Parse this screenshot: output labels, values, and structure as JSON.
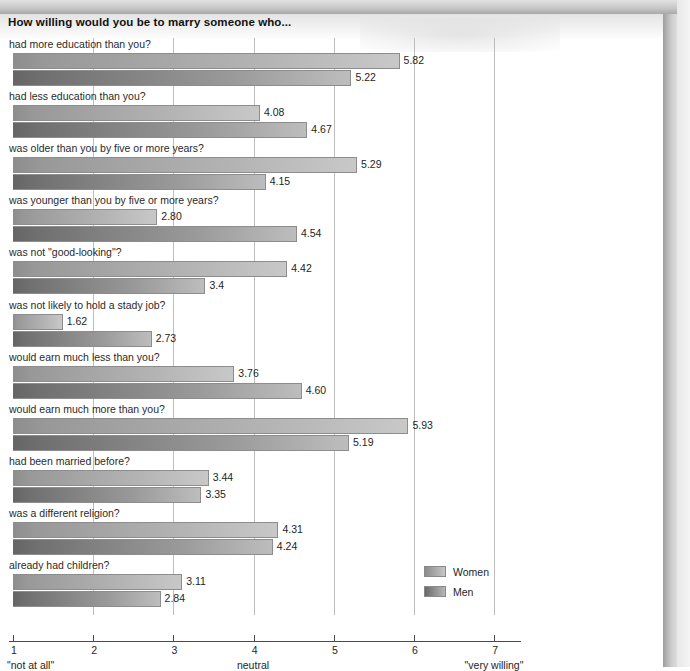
{
  "title": "How willing would you be to marry someone who...",
  "axis": {
    "ticks": [
      "1",
      "2",
      "3",
      "4",
      "5",
      "6",
      "7"
    ],
    "tick_values": [
      1,
      2,
      3,
      4,
      5,
      6,
      7
    ],
    "anno_left": "\"not at all\"",
    "anno_mid": "neutral",
    "anno_right": "\"very willing\""
  },
  "legend": {
    "items": [
      {
        "label": "Women",
        "key": "women"
      },
      {
        "label": "Men",
        "key": "men"
      }
    ]
  },
  "chart_data": {
    "type": "bar",
    "orientation": "horizontal",
    "title": "How willing would you be to marry someone who...",
    "xlabel": "",
    "ylabel": "",
    "xlim": [
      1,
      7
    ],
    "grid": true,
    "legend_position": "bottom-right",
    "scale_labels": {
      "1": "\"not at all\"",
      "4": "neutral",
      "7": "\"very willing\""
    },
    "categories": [
      "had more education than you?",
      "had less education than you?",
      "was older than you by five or more years?",
      "was younger than you by five or more years?",
      "was not \"good-looking\"?",
      "was not likely to hold a stady job?",
      "would earn much less than you?",
      "would earn much more than you?",
      "had been married before?",
      "was a different religion?",
      "already had children?"
    ],
    "series": [
      {
        "name": "Women",
        "values": [
          5.82,
          4.08,
          5.29,
          2.8,
          4.42,
          1.62,
          3.76,
          5.93,
          3.44,
          4.31,
          3.11
        ],
        "labels": [
          "5.82",
          "4.08",
          "5.29",
          "2.80",
          "4.42",
          "1.62",
          "3.76",
          "5.93",
          "3.44",
          "4.31",
          "3.11"
        ]
      },
      {
        "name": "Men",
        "values": [
          5.22,
          4.67,
          4.15,
          4.54,
          3.4,
          2.73,
          4.6,
          5.19,
          3.35,
          4.24,
          2.84
        ],
        "labels": [
          "5.22",
          "4.67",
          "4.15",
          "4.54",
          "3.4",
          "2.73",
          "4.60",
          "5.19",
          "3.35",
          "4.24",
          "2.84"
        ]
      }
    ]
  }
}
